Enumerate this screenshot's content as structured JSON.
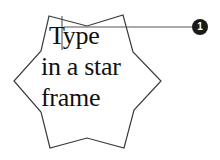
{
  "star_frame": {
    "text_lines": [
      "Type",
      "in a star",
      "frame"
    ],
    "stroke_color": "#3a3a3a",
    "fill_color": "#ffffff"
  },
  "text_cursor": {
    "icon": "i-beam-cursor-icon"
  },
  "callout": {
    "number": "1",
    "badge_color": "#1a1a1a",
    "line_color": "#555555"
  }
}
